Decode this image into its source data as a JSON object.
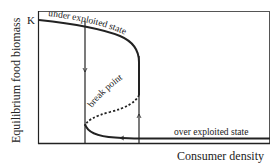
{
  "diagram": {
    "y_axis_label": "Equilibrium food biomass",
    "x_axis_label": "Consumer density",
    "k_label": "K",
    "branch_labels": {
      "upper": "under exploited state",
      "middle": "break point",
      "lower": "over exploited state"
    },
    "colors": {
      "line": "#222222",
      "frame": "#333333",
      "background": "#ffffff"
    }
  }
}
